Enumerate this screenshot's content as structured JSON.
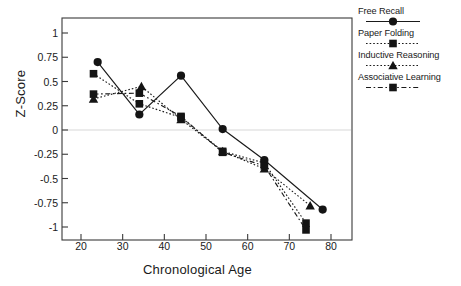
{
  "chart_data": {
    "type": "line",
    "title": "",
    "subtitle": "",
    "xlabel": "Chronological Age",
    "ylabel": "Z-Score",
    "xlim": [
      16,
      84
    ],
    "ylim": [
      -1.15,
      1.18
    ],
    "xticks": [
      20,
      30,
      40,
      50,
      60,
      70,
      80
    ],
    "yticks": [
      1,
      0.75,
      0.5,
      0.25,
      0,
      -0.25,
      -0.5,
      -0.75,
      -1
    ],
    "ytick_labels": [
      "1",
      "0.75",
      "0.5",
      "0.25",
      "0",
      "-0.25",
      "-0.5",
      "-0.75",
      "-1"
    ],
    "xtick_labels": [
      "20",
      "30",
      "40",
      "50",
      "60",
      "70",
      "80"
    ],
    "grid": false,
    "zero_line": true,
    "legend_position": "right",
    "series": [
      {
        "name": "Free Recall",
        "marker": "circle",
        "line_style": "solid",
        "color": "#1a1a1a",
        "x": [
          24,
          34,
          44,
          54,
          64,
          78
        ],
        "values": [
          0.7,
          0.16,
          0.56,
          0.01,
          -0.31,
          -0.82
        ]
      },
      {
        "name": "Paper Folding",
        "marker": "square",
        "line_style": "dotted",
        "color": "#1a1a1a",
        "x": [
          23,
          34,
          44,
          54,
          64,
          74
        ],
        "values": [
          0.58,
          0.27,
          0.13,
          -0.22,
          -0.34,
          -0.96
        ]
      },
      {
        "name": "Inductive Reasoning",
        "marker": "triangle",
        "line_style": "dotted",
        "color": "#1a1a1a",
        "x": [
          23,
          34.5,
          44,
          54,
          64,
          75
        ],
        "values": [
          0.32,
          0.45,
          0.11,
          -0.22,
          -0.4,
          -0.78
        ]
      },
      {
        "name": "Associative Learning",
        "marker": "square",
        "line_style": "dashed",
        "color": "#1a1a1a",
        "x": [
          23,
          34,
          44,
          54,
          64,
          74
        ],
        "values": [
          0.37,
          0.38,
          0.14,
          -0.23,
          -0.37,
          -1.03
        ]
      }
    ]
  },
  "legend": {
    "entries": [
      {
        "label": "Free Recall"
      },
      {
        "label": "Paper Folding"
      },
      {
        "label": "Inductive Reasoning"
      },
      {
        "label": "Associative Learning"
      }
    ]
  }
}
